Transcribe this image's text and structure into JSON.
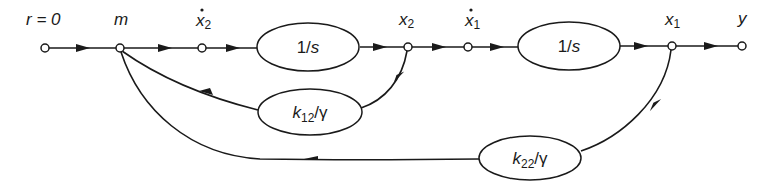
{
  "diagram": {
    "type": "signal-flow-graph",
    "nodes": [
      {
        "id": "r",
        "label": "r = 0",
        "x": 45,
        "y": 48
      },
      {
        "id": "m",
        "label": "m",
        "x": 120,
        "y": 48
      },
      {
        "id": "x2dot",
        "label_base": "x",
        "label_sub": "2",
        "dot": true,
        "x": 202,
        "y": 48
      },
      {
        "id": "x2",
        "label_base": "x",
        "label_sub": "2",
        "dot": false,
        "x": 408,
        "y": 47
      },
      {
        "id": "x1dot",
        "label_base": "x",
        "label_sub": "1",
        "dot": true,
        "x": 468,
        "y": 47
      },
      {
        "id": "x1",
        "label_base": "x",
        "label_sub": "1",
        "dot": false,
        "x": 672,
        "y": 46
      },
      {
        "id": "y",
        "label": "y",
        "x": 742,
        "y": 46
      }
    ],
    "blocks": [
      {
        "id": "integrator-2",
        "label": "1/s",
        "cx": 308,
        "cy": 47
      },
      {
        "id": "integrator-1",
        "label": "1/s",
        "cx": 569,
        "cy": 46
      },
      {
        "id": "gain-k12",
        "label_base": "k",
        "label_sub": "12",
        "label_tail": "/γ",
        "cx": 310,
        "cy": 112
      },
      {
        "id": "gain-k22",
        "label_base": "k",
        "label_sub": "22",
        "label_tail": "/γ",
        "cx": 530,
        "cy": 158
      }
    ],
    "edges": [
      {
        "from": "r",
        "to": "m"
      },
      {
        "from": "m",
        "to": "x2dot"
      },
      {
        "from": "x2dot",
        "to": "integrator-2"
      },
      {
        "from": "integrator-2",
        "to": "x2"
      },
      {
        "from": "x2",
        "to": "x1dot"
      },
      {
        "from": "x1dot",
        "to": "integrator-1"
      },
      {
        "from": "integrator-1",
        "to": "x1"
      },
      {
        "from": "x1",
        "to": "y"
      },
      {
        "from": "x2",
        "to": "gain-k12"
      },
      {
        "from": "gain-k12",
        "to": "m"
      },
      {
        "from": "x1",
        "to": "gain-k22"
      },
      {
        "from": "gain-k22",
        "to": "m"
      }
    ]
  }
}
